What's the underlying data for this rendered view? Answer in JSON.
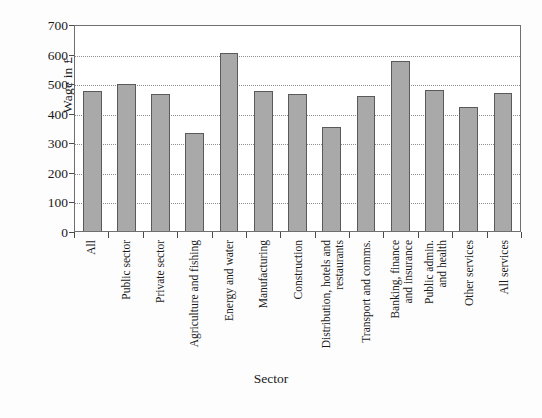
{
  "chart_data": {
    "type": "bar",
    "title": "",
    "xlabel": "Sector",
    "ylabel": "Wage in £",
    "ylim": [
      0,
      700
    ],
    "yticks": [
      0,
      100,
      200,
      300,
      400,
      500,
      600,
      700
    ],
    "ytick_labels": [
      "0",
      "100",
      "200",
      "300",
      "400",
      "500",
      "600",
      "700"
    ],
    "grid": true,
    "legend": null,
    "bar_color": "#a9a9a9",
    "bar_edge_color": "#5a5a5a",
    "categories": [
      "All",
      "Public sector",
      "Private sector",
      "Agriculture and fishing",
      "Energy and water",
      "Manufacturing",
      "Construction",
      "Distribution, hotels and restaurants",
      "Transport and comms.",
      "Banking, finance and insurance",
      "Public admin. and health",
      "Other services",
      "All services"
    ],
    "category_lines": [
      [
        "All"
      ],
      [
        "Public sector"
      ],
      [
        "Private sector"
      ],
      [
        "Agriculture and fishing"
      ],
      [
        "Energy and water"
      ],
      [
        "Manufacturing"
      ],
      [
        "Construction"
      ],
      [
        "Distribution, hotels and",
        "restaurants"
      ],
      [
        "Transport and comms."
      ],
      [
        "Banking, finance",
        "and insurance"
      ],
      [
        "Public admin.",
        "and health"
      ],
      [
        "Other services"
      ],
      [
        "All services"
      ]
    ],
    "values": [
      475,
      498,
      462,
      330,
      603,
      473,
      465,
      352,
      458,
      575,
      477,
      420,
      466
    ]
  }
}
